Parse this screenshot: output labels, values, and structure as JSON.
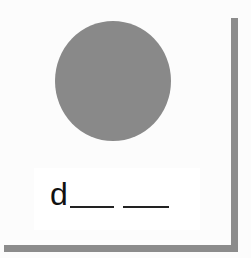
{
  "worksheet": {
    "shape": {
      "type": "circle",
      "color": "#898989"
    },
    "word_prompt": {
      "first_letter": "d",
      "blank_count": 2
    },
    "colors": {
      "shadow": "#8c8c8c",
      "background": "#fcfcfc"
    }
  }
}
